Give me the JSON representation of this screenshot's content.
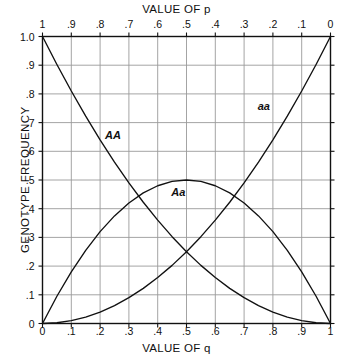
{
  "chart_data": {
    "type": "line",
    "title": "",
    "xlabel": "VALUE OF q",
    "xlabel_top": "VALUE OF p",
    "ylabel": "GENOTYPE FREQUENCY",
    "xlim": [
      0,
      1
    ],
    "ylim": [
      0,
      1
    ],
    "grid": true,
    "legend_position": "inline-annotations",
    "axes": {
      "top": {
        "label": "VALUE OF p",
        "ticks": [
          "1",
          ".9",
          ".8",
          ".7",
          ".6",
          ".5",
          ".4",
          ".3",
          ".2",
          ".1",
          "0"
        ],
        "values": [
          1.0,
          0.9,
          0.8,
          0.7,
          0.6,
          0.5,
          0.4,
          0.3,
          0.2,
          0.1,
          0.0
        ],
        "direction": "decreasing"
      },
      "bottom": {
        "label": "VALUE OF q",
        "ticks": [
          "0",
          ".1",
          ".2",
          ".3",
          ".4",
          ".5",
          ".6",
          ".7",
          ".8",
          ".9",
          "1"
        ],
        "values": [
          0.0,
          0.1,
          0.2,
          0.3,
          0.4,
          0.5,
          0.6,
          0.7,
          0.8,
          0.9,
          1.0
        ],
        "direction": "increasing"
      },
      "left": {
        "label": "GENOTYPE FREQUENCY",
        "ticks": [
          "1.0",
          ".9",
          ".8",
          ".7",
          ".6",
          ".5",
          ".4",
          ".3",
          ".2",
          ".1",
          "0"
        ],
        "values": [
          1.0,
          0.9,
          0.8,
          0.7,
          0.6,
          0.5,
          0.4,
          0.3,
          0.2,
          0.1,
          0.0
        ],
        "direction": "decreasing-downward"
      }
    },
    "x": [
      0.0,
      0.05,
      0.1,
      0.15,
      0.2,
      0.25,
      0.3,
      0.35,
      0.4,
      0.45,
      0.5,
      0.55,
      0.6,
      0.65,
      0.7,
      0.75,
      0.8,
      0.85,
      0.9,
      0.95,
      1.0
    ],
    "series": [
      {
        "name": "AA",
        "annotation": "AA",
        "formula": "p squared",
        "values": [
          1.0,
          0.9025,
          0.81,
          0.7225,
          0.64,
          0.5625,
          0.49,
          0.4225,
          0.36,
          0.3025,
          0.25,
          0.2025,
          0.16,
          0.1225,
          0.09,
          0.0625,
          0.04,
          0.0225,
          0.01,
          0.0025,
          0.0
        ]
      },
      {
        "name": "Aa",
        "annotation": "Aa",
        "formula": "2pq",
        "values": [
          0.0,
          0.095,
          0.18,
          0.255,
          0.32,
          0.375,
          0.42,
          0.455,
          0.48,
          0.495,
          0.5,
          0.495,
          0.48,
          0.455,
          0.42,
          0.375,
          0.32,
          0.255,
          0.18,
          0.095,
          0.0
        ]
      },
      {
        "name": "aa",
        "annotation": "aa",
        "formula": "q squared",
        "values": [
          0.0,
          0.0025,
          0.01,
          0.0225,
          0.04,
          0.0625,
          0.09,
          0.1225,
          0.16,
          0.2025,
          0.25,
          0.3025,
          0.36,
          0.4225,
          0.49,
          0.5625,
          0.64,
          0.7225,
          0.81,
          0.9025,
          1.0
        ]
      }
    ],
    "annotations": [
      {
        "text": "AA",
        "x": 0.245,
        "y": 0.655
      },
      {
        "text": "Aa",
        "x": 0.475,
        "y": 0.455
      },
      {
        "text": "aa",
        "x": 0.775,
        "y": 0.755
      }
    ],
    "colors": {
      "curve": "#111111",
      "grid": "#9a9a9a",
      "frame": "#111111",
      "background": "#ffffff"
    }
  }
}
